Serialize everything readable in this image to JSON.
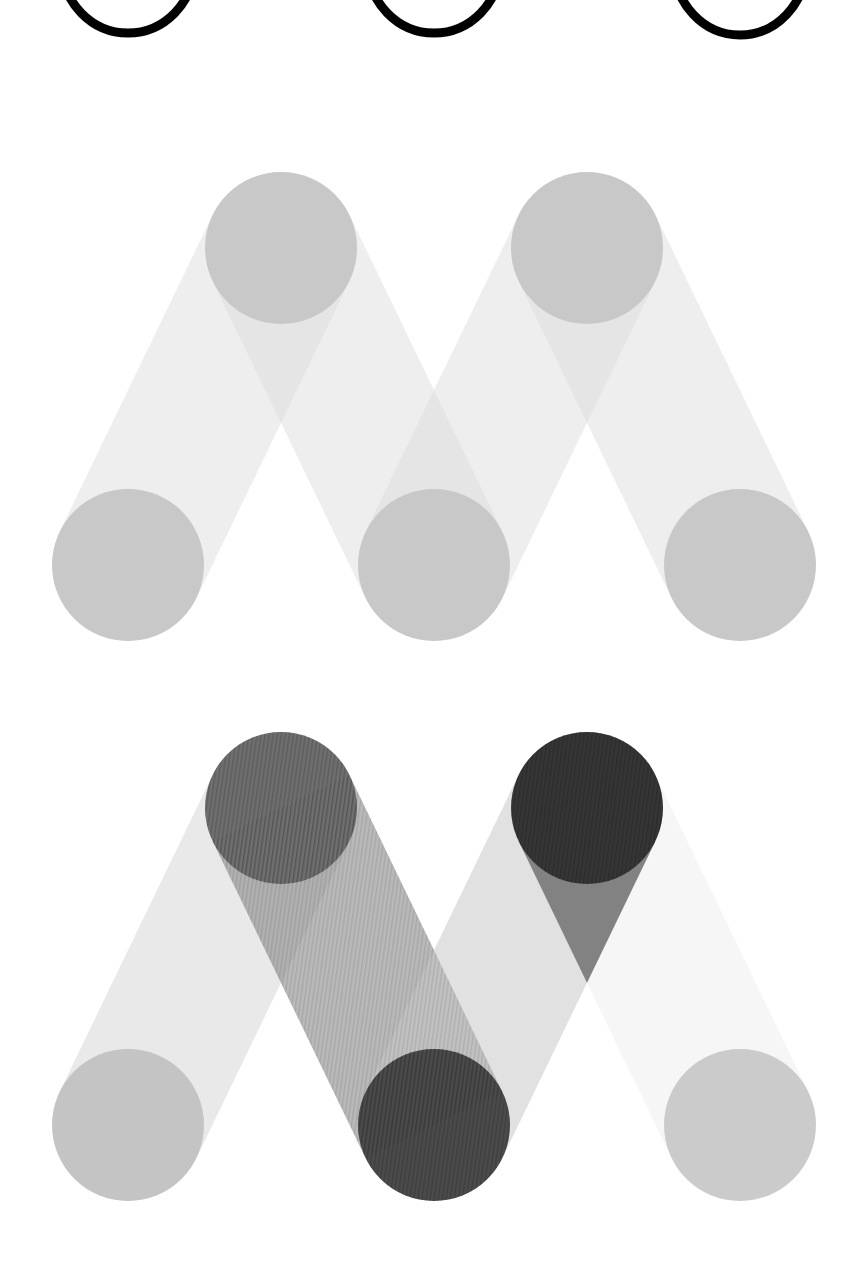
{
  "figure": {
    "background": "#ffffff",
    "circle_radius": 76,
    "band_width": 152
  },
  "top_rings": {
    "color": "#000000",
    "stroke_width": 9,
    "rings": [
      {
        "cx": 128,
        "cy": -35,
        "rx": 66,
        "ry": 68
      },
      {
        "cx": 434,
        "cy": -35,
        "rx": 66,
        "ry": 68
      },
      {
        "cx": 740,
        "cy": -35,
        "rx": 66,
        "ry": 70
      }
    ]
  },
  "m_light": {
    "label": "M construction (uniform gray)",
    "nodes": [
      {
        "id": "b1",
        "cx": 128,
        "cy": 565,
        "fill": "#c8c8c8"
      },
      {
        "id": "t1",
        "cx": 281,
        "cy": 248,
        "fill": "#c8c8c8"
      },
      {
        "id": "b2",
        "cx": 434,
        "cy": 565,
        "fill": "#c8c8c8"
      },
      {
        "id": "t2",
        "cx": 587,
        "cy": 248,
        "fill": "#c8c8c8"
      },
      {
        "id": "b3",
        "cx": 740,
        "cy": 565,
        "fill": "#c8c8c8"
      }
    ],
    "bands": [
      {
        "from": "b1",
        "to": "t1",
        "fill": "#d9d9d9",
        "opacity": 0.45
      },
      {
        "from": "t1",
        "to": "b2",
        "fill": "#d9d9d9",
        "opacity": 0.45
      },
      {
        "from": "b2",
        "to": "t2",
        "fill": "#d9d9d9",
        "opacity": 0.45
      },
      {
        "from": "t2",
        "to": "b3",
        "fill": "#d9d9d9",
        "opacity": 0.45
      }
    ]
  },
  "m_shaded": {
    "label": "M construction (weighted shading)",
    "nodes": [
      {
        "id": "b1",
        "cx": 128,
        "cy": 1125,
        "fill": "#c4c4c4"
      },
      {
        "id": "t1",
        "cx": 281,
        "cy": 808,
        "fill": "#6f6f6f"
      },
      {
        "id": "b2",
        "cx": 434,
        "cy": 1125,
        "fill": "#4b4b4b"
      },
      {
        "id": "t2",
        "cx": 587,
        "cy": 808,
        "fill": "#353535"
      },
      {
        "id": "b3",
        "cx": 740,
        "cy": 1125,
        "fill": "#cbcbcb"
      }
    ],
    "bands": [
      {
        "from": "b1",
        "to": "t1",
        "fill": "#d4d4d4",
        "opacity": 0.5
      },
      {
        "from": "t1",
        "to": "b2",
        "fill": "#8a8a8a",
        "opacity": 0.6
      },
      {
        "from": "b2",
        "to": "t2",
        "fill": "#c8c8c8",
        "opacity": 0.55
      },
      {
        "from": "t2",
        "to": "b3",
        "fill": "#e6e6e6",
        "opacity": 0.35
      }
    ],
    "overlays": [
      {
        "between": "t2-b2 upper wedge",
        "fill": "#5a5a5a",
        "opacity": 0.7
      }
    ],
    "texture": "fine vertical stripes on dark elements"
  }
}
